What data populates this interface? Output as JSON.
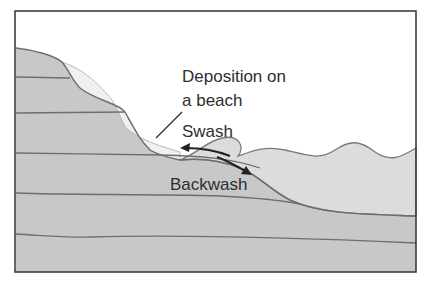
{
  "diagram": {
    "labels": {
      "deposition_line1": "Deposition on",
      "deposition_line2": "a beach",
      "swash": "Swash",
      "backwash": "Backwash"
    },
    "colors": {
      "rock": "#c8c8c8",
      "rock_line": "#6e6e6e",
      "beach_deposit": "#eeeeee",
      "sea": "#dcdcdc",
      "frame": "#333333",
      "text": "#2e2e2e"
    }
  }
}
